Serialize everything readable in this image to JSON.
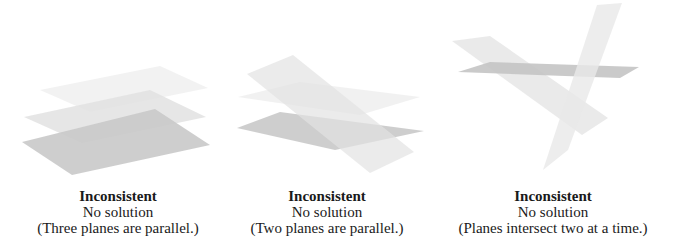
{
  "panels": [
    {
      "title": "Inconsistent",
      "result": "No solution",
      "note": "(Three planes are parallel.)",
      "colors": {
        "top_plane": "#f1f1f1",
        "middle_plane": "#e2e2e2",
        "bottom_plane": "#c9c9c9"
      }
    },
    {
      "title": "Inconsistent",
      "result": "No solution",
      "note": "(Two planes are parallel.)",
      "colors": {
        "faint_plane": "#f0f0f0",
        "tilted_plane": "#e4e4e4",
        "bottom_plane": "#cbcbcb"
      }
    },
    {
      "title": "Inconsistent",
      "result": "No solution",
      "note": "(Planes intersect two at a time.)",
      "colors": {
        "horizontal_plane": "#c9c9c9",
        "diagonal_plane": "#e6e6e6",
        "steep_plane": "#e9e9e9"
      }
    }
  ]
}
